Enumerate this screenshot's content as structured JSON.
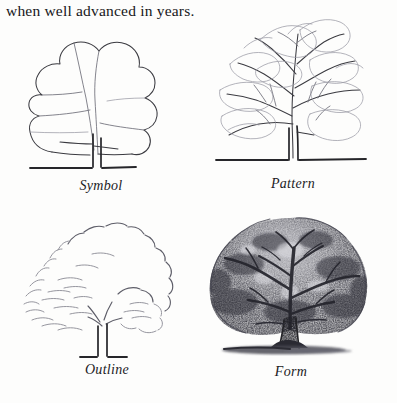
{
  "page": {
    "caption_top": "when well advanced in years.",
    "background_color": "#fdfdfc",
    "ink_color": "#3a3a40"
  },
  "figure": {
    "layout": "2x2 grid of pencil tree studies",
    "panels": [
      {
        "id": "symbol",
        "label": "Symbol",
        "description": "Simple flowing outline silhouette of a tree crown with a single thin trunk and one low branch, resting on a short horizontal ground line.",
        "icon": "tree-symbol-icon"
      },
      {
        "id": "pattern",
        "label": "Pattern",
        "description": "Branch skeleton radiating from a slender double-line trunk, with scalloped foliage clump outlines drawn as light contours.",
        "icon": "tree-pattern-icon"
      },
      {
        "id": "outline",
        "label": "Outline",
        "description": "Broken, bumpy dashed edge describing the foliage silhouette with sparse interior marks and a light open trunk.",
        "icon": "tree-outline-icon"
      },
      {
        "id": "form",
        "label": "Form",
        "description": "Fully rendered dense graphite tree with dark tonal canopy, visible limb structure, thick shaded trunk and a cast ground shadow.",
        "icon": "tree-form-icon"
      }
    ]
  }
}
